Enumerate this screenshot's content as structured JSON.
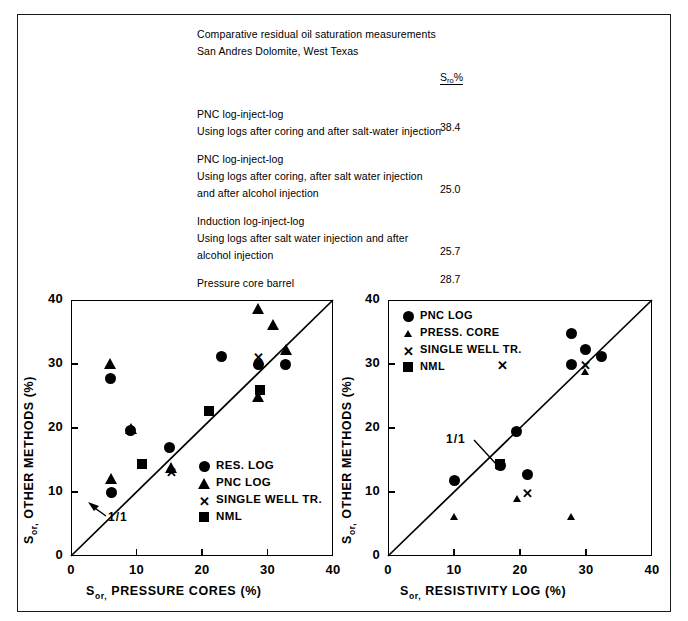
{
  "header": {
    "lines": [
      "Comparative residual oil saturation measurements",
      "San Andres Dolomite, West Texas"
    ],
    "value_column_header": "S",
    "value_column_sub": "ro",
    "value_column_pct": "%",
    "entries": [
      {
        "lines": [
          "PNC log-inject-log",
          "Using logs after coring and after salt-water injection"
        ],
        "value": "38.4"
      },
      {
        "lines": [
          "PNC log-inject-log",
          "Using logs after coring, after salt water injection",
          "and after alcohol injection"
        ],
        "value": "25.0"
      },
      {
        "lines": [
          "Induction log-inject-log",
          "Using logs after salt water injection and after",
          "alcohol injection"
        ],
        "value": "25.7"
      },
      {
        "lines": [
          "Pressure core barrel"
        ],
        "value": "28.7"
      }
    ]
  },
  "chart_data": [
    {
      "id": "left",
      "type": "scatter",
      "title": "",
      "xlabel": "S_or, PRESSURE CORES (%)",
      "xlabel_main": "S",
      "xlabel_sub": "or,",
      "xlabel_rest": " PRESSURE CORES (%)",
      "ylabel": "S_or, OTHER METHODS (%)",
      "ylabel_main": "S",
      "ylabel_sub": "or,",
      "ylabel_rest": " OTHER METHODS (%)",
      "xlim": [
        0,
        40
      ],
      "ylim": [
        0,
        40
      ],
      "xticks": [
        0,
        10,
        20,
        30,
        40
      ],
      "yticks": [
        0,
        10,
        20,
        30,
        40
      ],
      "xticklabels": [
        "0",
        "10",
        "20",
        "30",
        "40"
      ],
      "yticklabels": [
        "0",
        "10",
        "20",
        "30",
        "40"
      ],
      "grid": false,
      "reference_line": {
        "label": "1/1",
        "from": [
          0,
          0
        ],
        "to": [
          40,
          40
        ]
      },
      "legend_position": "lower-right",
      "series": [
        {
          "name": "RES. LOG",
          "marker": "circle",
          "points": [
            [
              6.0,
              27.8
            ],
            [
              6.2,
              10.0
            ],
            [
              9.1,
              19.6
            ],
            [
              15.1,
              17.0
            ],
            [
              23.0,
              31.1
            ],
            [
              28.7,
              30.0
            ],
            [
              32.8,
              30.0
            ]
          ]
        },
        {
          "name": "PNC LOG",
          "marker": "triangle",
          "points": [
            [
              6.0,
              30.1
            ],
            [
              6.1,
              12.1
            ],
            [
              9.2,
              20.0
            ],
            [
              15.2,
              13.9
            ],
            [
              28.6,
              38.7
            ],
            [
              30.8,
              36.2
            ],
            [
              28.6,
              25.0
            ],
            [
              32.8,
              32.2
            ]
          ]
        },
        {
          "name": "SINGLE WELL TR.",
          "marker": "x",
          "points": [
            [
              15.2,
              13.2
            ],
            [
              28.6,
              31.1
            ]
          ]
        },
        {
          "name": "NML",
          "marker": "square",
          "points": [
            [
              10.9,
              14.3
            ],
            [
              21.0,
              22.6
            ],
            [
              28.9,
              25.9
            ]
          ]
        }
      ]
    },
    {
      "id": "right",
      "type": "scatter",
      "title": "",
      "xlabel": "S_or, RESISTIVITY LOG (%)",
      "xlabel_main": "S",
      "xlabel_sub": "or,",
      "xlabel_rest": " RESISTIVITY LOG (%)",
      "ylabel": "S_or, OTHER METHODS (%)",
      "ylabel_main": "S",
      "ylabel_sub": "or,",
      "ylabel_rest": " OTHER METHODS (%)",
      "xlim": [
        0,
        40
      ],
      "ylim": [
        0,
        40
      ],
      "xticks": [
        0,
        10,
        20,
        30,
        40
      ],
      "yticks": [
        0,
        10,
        20,
        30,
        40
      ],
      "xticklabels": [
        "0",
        "10",
        "20",
        "30",
        "40"
      ],
      "yticklabels": [
        "0",
        "10",
        "20",
        "30",
        "40"
      ],
      "grid": false,
      "reference_line": {
        "label": "1/1",
        "from": [
          0,
          0
        ],
        "to": [
          40,
          40
        ]
      },
      "legend_position": "upper-left",
      "series": [
        {
          "name": "PNC LOG",
          "marker": "circle",
          "points": [
            [
              10.0,
              11.8
            ],
            [
              17.0,
              14.2
            ],
            [
              19.5,
              19.5
            ],
            [
              21.2,
              12.8
            ],
            [
              27.8,
              34.8
            ],
            [
              27.8,
              29.9
            ],
            [
              32.4,
              31.2
            ],
            [
              29.9,
              32.2
            ]
          ]
        },
        {
          "name": "PRESS. CORE",
          "marker": "triangle-small",
          "points": [
            [
              10.0,
              6.1
            ],
            [
              17.0,
              14.0
            ],
            [
              19.6,
              9.0
            ],
            [
              27.8,
              6.1
            ],
            [
              29.9,
              28.8
            ],
            [
              29.9,
              32.4
            ]
          ]
        },
        {
          "name": "SINGLE WELL TR.",
          "marker": "x",
          "points": [
            [
              17.3,
              30.0
            ],
            [
              21.0,
              10.0
            ],
            [
              29.8,
              29.9
            ]
          ]
        },
        {
          "name": "NML",
          "marker": "square",
          "points": [
            [
              17.0,
              14.4
            ]
          ]
        }
      ]
    }
  ]
}
